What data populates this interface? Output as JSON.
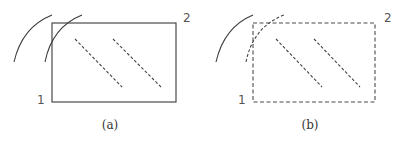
{
  "figure": {
    "panels": [
      {
        "id": "a",
        "caption": "(a)",
        "corner_label_bottom_left": "1",
        "corner_label_top_right": "2",
        "rectangle_style": "solid",
        "outer_arc_style": "solid",
        "inner_arc_style": "solid",
        "diagonal_style": "dashed"
      },
      {
        "id": "b",
        "caption": "(b)",
        "corner_label_bottom_left": "1",
        "corner_label_top_right": "2",
        "rectangle_style": "dashed",
        "outer_arc_style": "solid",
        "inner_arc_style": "dashed",
        "diagonal_style": "dashed"
      }
    ],
    "colors": {
      "line": "#3a3a3a",
      "label": "#555555",
      "background": "#ffffff"
    }
  }
}
